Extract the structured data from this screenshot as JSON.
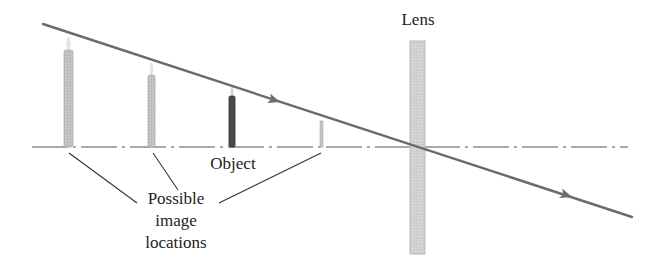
{
  "diagram": {
    "labels": {
      "lens": "Lens",
      "object": "Object",
      "possible_image_locations": [
        "Possible",
        "image",
        "locations"
      ]
    },
    "colors": {
      "ray": "#6b6b6b",
      "axis": "#555555",
      "lens_fill": "#d4d4d4",
      "lens_stroke": "#b8b8b8",
      "candle_light": "#bdbdbd",
      "candle_object": "#4a4a4a",
      "flame": "#e6e6e6",
      "text": "#222222",
      "leader": "#333333"
    },
    "optical_axis": {
      "x1": 32,
      "x2": 628,
      "y": 147,
      "style": "dash-dot"
    },
    "lens": {
      "x": 410,
      "y": 41,
      "width": 15,
      "height": 213
    },
    "ray": {
      "start": [
        43,
        24
      ],
      "end": [
        632,
        217
      ],
      "arrowheads": [
        [
          277,
          101
        ],
        [
          569,
          198
        ]
      ]
    },
    "candles": [
      {
        "role": "possible-image",
        "x": 64,
        "top": 50,
        "width": 9,
        "flame_top": 37,
        "shade": "light"
      },
      {
        "role": "possible-image",
        "x": 148,
        "top": 75,
        "width": 7,
        "flame_top": 63,
        "shade": "light"
      },
      {
        "role": "object",
        "x": 229,
        "top": 96,
        "width": 6,
        "flame_top": 87,
        "shade": "dark"
      },
      {
        "role": "possible-image",
        "x": 320,
        "top": 121,
        "width": 3,
        "flame_top": 121,
        "shade": "light"
      }
    ],
    "leader_lines": [
      {
        "from": [
          69,
          153
        ],
        "to": [
          137,
          203
        ]
      },
      {
        "from": [
          153,
          153
        ],
        "to": [
          178,
          190
        ]
      },
      {
        "from": [
          321,
          153
        ],
        "to": [
          219,
          203
        ]
      }
    ]
  }
}
